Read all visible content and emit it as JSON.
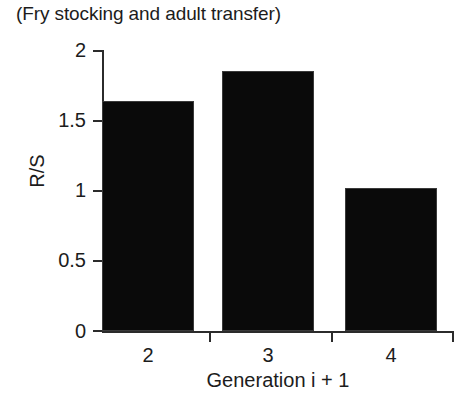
{
  "chart_data": {
    "type": "bar",
    "title": "(Fry stocking and adult transfer)",
    "xlabel": "Generation i + 1",
    "ylabel": "R/S",
    "categories": [
      "2",
      "3",
      "4"
    ],
    "values": [
      1.64,
      1.85,
      1.02
    ],
    "ylim": [
      0,
      2
    ],
    "yticks": [
      "0",
      "0.5",
      "1",
      "1.5",
      "2"
    ],
    "ytick_values": [
      0,
      0.5,
      1,
      1.5,
      2
    ],
    "xtick_labels": [
      "2",
      "3",
      "4"
    ],
    "grid": false,
    "legend": null,
    "bar_color": "#0a0a0a",
    "axis_color": "#2b2b2b",
    "background": "#ffffff"
  }
}
